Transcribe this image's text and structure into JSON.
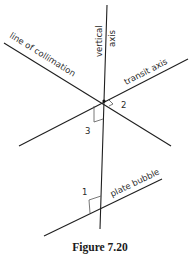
{
  "figure": {
    "caption": "Figure 7.20",
    "lines": {
      "vertical_axis": {
        "label_line1": "vertical",
        "label_line2": "axis"
      },
      "line_of_collimation": {
        "label": "line of collimation"
      },
      "transit_axis": {
        "label": "transit axis"
      },
      "plate_bubble": {
        "label": "plate bubble"
      }
    },
    "angle_markers": [
      {
        "id": "1",
        "label": "1"
      },
      {
        "id": "2",
        "label": "2"
      },
      {
        "id": "3",
        "label": "3"
      }
    ]
  }
}
